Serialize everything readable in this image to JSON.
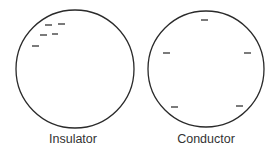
{
  "diagram": {
    "colors": {
      "stroke": "#2a2a2a",
      "charge": "#222222",
      "text": "#333333"
    },
    "spheres": [
      {
        "label": "Insulator",
        "cx": 75,
        "cy": 69,
        "r": 59,
        "charges": [
          {
            "x1": 45,
            "x2": 52,
            "y": 25
          },
          {
            "x1": 58,
            "x2": 65,
            "y": 24
          },
          {
            "x1": 40,
            "x2": 47,
            "y": 35
          },
          {
            "x1": 52,
            "x2": 58,
            "y": 34
          },
          {
            "x1": 32,
            "x2": 39,
            "y": 46
          }
        ]
      },
      {
        "label": "Conductor",
        "cx": 206,
        "cy": 69,
        "r": 58,
        "charges": [
          {
            "x1": 201,
            "x2": 208,
            "y": 20
          },
          {
            "x1": 163,
            "x2": 170,
            "y": 53
          },
          {
            "x1": 244,
            "x2": 251,
            "y": 53
          },
          {
            "x1": 171,
            "x2": 178,
            "y": 107
          },
          {
            "x1": 236,
            "x2": 243,
            "y": 106
          }
        ]
      }
    ],
    "charge_symbol": "−"
  }
}
